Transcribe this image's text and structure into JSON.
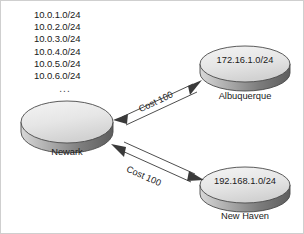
{
  "diagram": {
    "background_color": "#ffffff",
    "border_color": "#cfcfcf",
    "subnet_list": {
      "items": [
        "10.0.1.0/24",
        "10.0.2.0/24",
        "10.0.3.0/24",
        "10.0.4.0/24",
        "10.0.5.0/24",
        "10.0.6.0/24"
      ],
      "ellipsis": "..."
    },
    "nodes": [
      {
        "id": "newark",
        "label": "Newark",
        "disc_text": "",
        "fill_top": "#e8e8e8",
        "fill_side": "#8f8f8f"
      },
      {
        "id": "albuquerque",
        "label": "Albuquerque",
        "disc_text": "172.16.1.0/24",
        "fill_top": "#e8e8e8",
        "fill_side": "#8f8f8f"
      },
      {
        "id": "newhaven",
        "label": "New Haven",
        "disc_text": "192.168.1.0/24",
        "fill_top": "#e8e8e8",
        "fill_side": "#8f8f8f"
      }
    ],
    "links": [
      {
        "id": "newark-albuquerque",
        "label": "Cost 100",
        "from": "newark",
        "to": "albuquerque",
        "style": "double-line-bidirectional-arrow",
        "color": "#3a3a3a"
      },
      {
        "id": "newark-newhaven",
        "label": "Cost 100",
        "from": "newark",
        "to": "newhaven",
        "style": "double-line-bidirectional-arrow",
        "color": "#3a3a3a"
      }
    ]
  }
}
